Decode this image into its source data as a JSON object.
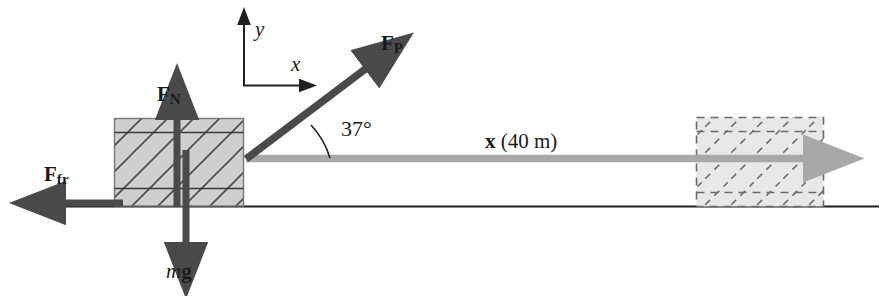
{
  "figure": {
    "background_color": "#ffffff"
  },
  "colors": {
    "dark_arrow": "#4a4a4a",
    "outline": "#2b2b2b",
    "block_fill": "#cfcfcf",
    "dashed_block_fill": "#e6e6e6",
    "displacement_arrow": "#a8a8a8",
    "ground_line": "#1f1f1f",
    "text": "#1a1a1a"
  },
  "labels": {
    "normal_force": {
      "symbol": "F",
      "subscript": "N"
    },
    "friction_force": {
      "symbol": "F",
      "subscript": "fr"
    },
    "applied_force": {
      "symbol": "F",
      "subscript": "P"
    },
    "weight": {
      "mass": "m",
      "gravity": "g"
    },
    "axis_y": "y",
    "axis_x": "x",
    "angle": "37°",
    "displacement": {
      "symbol": "x",
      "value": "(40 m)"
    }
  },
  "geometry": {
    "ground_y": 206,
    "block_start": {
      "x": 114,
      "y": 118,
      "width": 130,
      "height": 88
    },
    "block_end": {
      "x": 696,
      "y": 117,
      "width": 128,
      "height": 90
    },
    "displacement_distance_m": 40,
    "applied_force_angle_deg": 37
  }
}
